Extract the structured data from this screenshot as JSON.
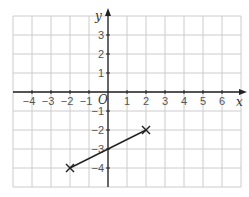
{
  "graph": {
    "x_range": [
      -5,
      7
    ],
    "y_range": [
      -5,
      4
    ],
    "x_axis_label": "x",
    "y_axis_label": "y",
    "origin_label": "O",
    "x_ticks": [
      "-4",
      "-3",
      "-2",
      "-1",
      "1",
      "2",
      "3",
      "4",
      "5",
      "6"
    ],
    "y_ticks": [
      "3",
      "2",
      "1",
      "-1",
      "-2",
      "-3",
      "-4"
    ],
    "points": [
      {
        "x": -2,
        "y": -4,
        "marker": "cross"
      },
      {
        "x": 2,
        "y": -2,
        "marker": "cross"
      }
    ],
    "segment": {
      "from": [
        -2,
        -4
      ],
      "to": [
        2,
        -2
      ]
    },
    "colors": {
      "grid": "#cccccc",
      "axis": "#222222",
      "line": "#222222",
      "label": "#555555"
    }
  }
}
